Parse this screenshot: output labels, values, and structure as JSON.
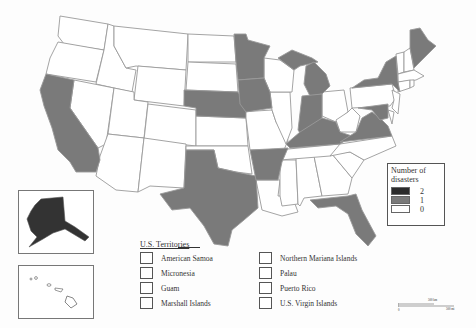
{
  "map": {
    "type": "choropleth",
    "region": "United States",
    "colors": {
      "two": "#2b2b2b",
      "one": "#7a7a7a",
      "zero": "#ffffff",
      "border": "#9a9a9a"
    },
    "shaded_states_one_disaster": [
      "California",
      "Nebraska",
      "Minnesota",
      "Iowa",
      "Wisconsin-north",
      "Michigan",
      "Indiana",
      "Kentucky",
      "Virginia",
      "Maryland",
      "New York",
      "Maine",
      "Texas",
      "Arkansas",
      "Florida",
      "Alaska"
    ]
  },
  "legend": {
    "title": "Number of disasters",
    "items": [
      {
        "label": "2",
        "color": "#2b2b2b"
      },
      {
        "label": "1",
        "color": "#7a7a7a"
      },
      {
        "label": "0",
        "color": "#ffffff"
      }
    ]
  },
  "insets": {
    "alaska": "Alaska",
    "hawaii": "Hawaii"
  },
  "territories": {
    "title": "U.S. Territories",
    "left": [
      "American Samoa",
      "Micronesia",
      "Guam",
      "Marshall Islands"
    ],
    "right": [
      "Northern Mariana Islands",
      "Palau",
      "Puerto Rico",
      "U.S. Virgin Islands"
    ]
  },
  "scale": {
    "label_top": "500 km",
    "label_right": "500 mi",
    "origin": "0"
  }
}
